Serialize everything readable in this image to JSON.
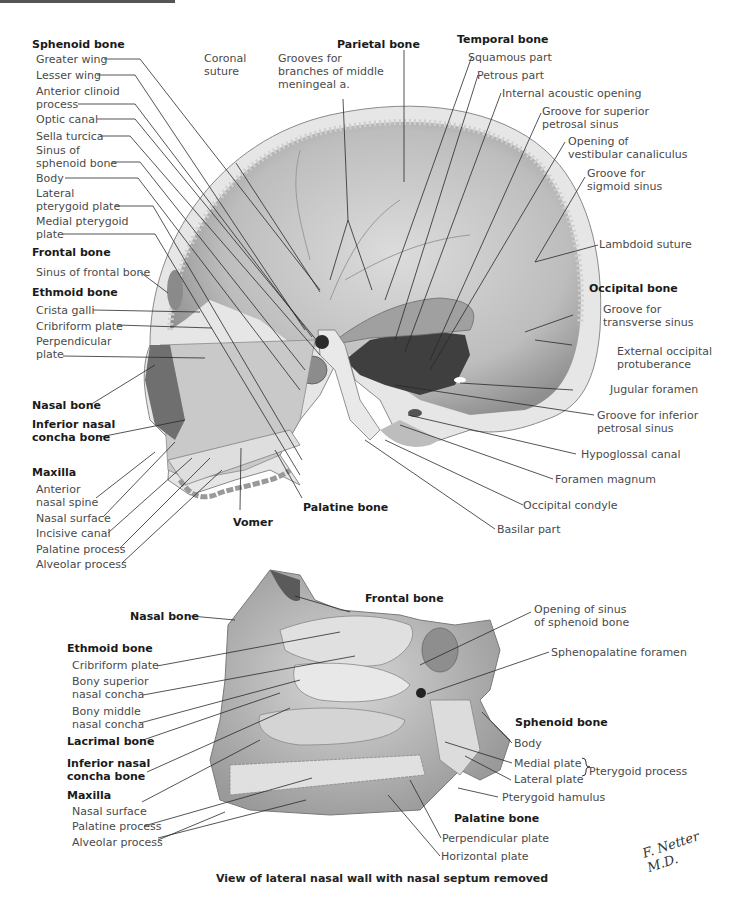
{
  "figure": {
    "caption": "View of lateral nasal wall with nasal septum removed",
    "signature": "F. Netter M.D."
  },
  "upper": {
    "sphenoid": {
      "header": "Sphenoid bone",
      "items": [
        "Greater wing",
        "Lesser wing",
        "Anterior clinoid\nprocess",
        "Optic canal",
        "Sella turcica",
        "Sinus of\nsphenoid bone",
        "Body",
        "Lateral\npterygoid plate",
        "Medial pterygoid\nplate"
      ]
    },
    "frontal": {
      "header": "Frontal bone",
      "items": [
        "Sinus of frontal bone"
      ]
    },
    "ethmoid": {
      "header": "Ethmoid bone",
      "items": [
        "Crista galli",
        "Cribriform plate",
        "Perpendicular\nplate"
      ]
    },
    "nasal_bone": "Nasal bone",
    "inferior_concha": "Inferior nasal\nconcha bone",
    "maxilla": {
      "header": "Maxilla",
      "items": [
        "Anterior\nnasal spine",
        "Nasal surface",
        "Incisive canal",
        "Palatine process",
        "Alveolar process"
      ]
    },
    "coronal_suture": "Coronal\nsuture",
    "grooves_meningeal": "Grooves for\nbranches of middle\nmeningeal a.",
    "parietal": "Parietal bone",
    "temporal": {
      "header": "Temporal bone",
      "items": [
        "Squamous part",
        "Petrous part",
        "Internal acoustic opening",
        "Groove for superior\npetrosal sinus",
        "Opening of\nvestibular canaliculus",
        "Groove for\nsigmoid sinus"
      ]
    },
    "lambdoid": "Lambdoid suture",
    "occipital": {
      "header": "Occipital bone",
      "items": [
        "Groove for\ntransverse sinus",
        "External occipital\nprotuberance",
        "Jugular foramen",
        "Groove for inferior\npetrosal sinus",
        "Hypoglossal canal",
        "Foramen magnum",
        "Occipital condyle",
        "Basilar part"
      ]
    },
    "vomer": "Vomer",
    "palatine": "Palatine bone"
  },
  "lower": {
    "nasal_bone": "Nasal bone",
    "frontal": "Frontal bone",
    "ethmoid": {
      "header": "Ethmoid bone",
      "items": [
        "Cribriform plate",
        "Bony superior\nnasal concha",
        "Bony middle\nnasal concha"
      ]
    },
    "lacrimal": "Lacrimal bone",
    "inferior_concha": "Inferior nasal\nconcha bone",
    "maxilla": {
      "header": "Maxilla",
      "items": [
        "Nasal surface",
        "Palatine process",
        "Alveolar process"
      ]
    },
    "sphenoid_sinus_opening": "Opening of sinus\nof sphenoid bone",
    "sphenopalatine": "Sphenopalatine foramen",
    "sphenoid": {
      "header": "Sphenoid bone",
      "items": [
        "Body",
        "Medial plate",
        "Lateral plate",
        "Pterygoid hamulus"
      ],
      "group_label": "Pterygoid process"
    },
    "palatine": {
      "header": "Palatine bone",
      "items": [
        "Perpendicular plate",
        "Horizontal plate"
      ]
    }
  }
}
